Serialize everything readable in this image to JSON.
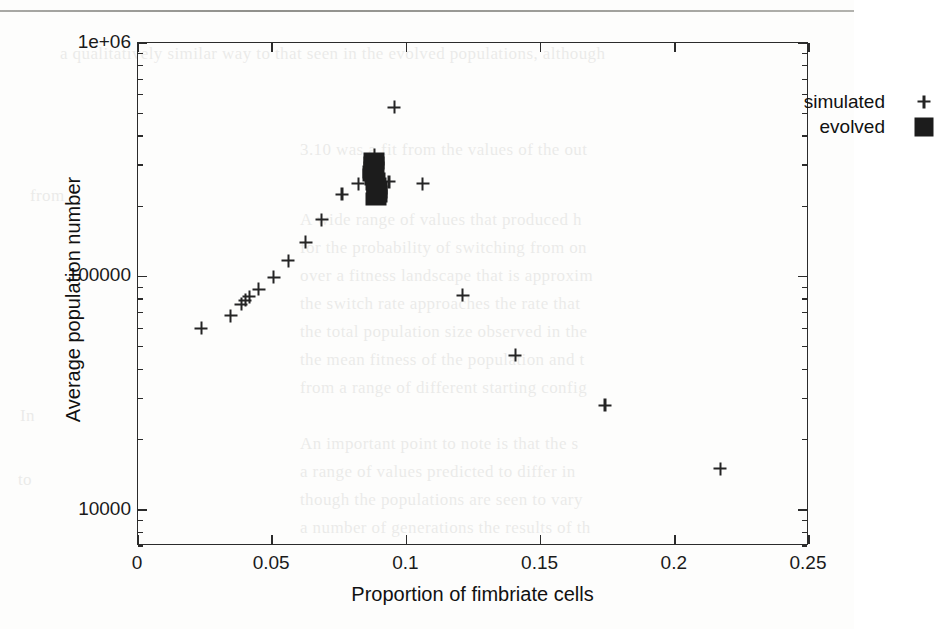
{
  "figure": {
    "xaxis_title": "Proportion of fimbriate cells",
    "yaxis_title": "Average population number"
  },
  "legend": {
    "position": "top-right",
    "entries": [
      {
        "label": "simulated",
        "marker": "plus-marker"
      },
      {
        "label": "evolved",
        "marker": "filled-square-marker"
      }
    ]
  },
  "axis_labels": {
    "x": [
      "0",
      "0.05",
      "0.1",
      "0.15",
      "0.2",
      "0.25"
    ],
    "y": [
      "10000",
      "100000",
      "1e+06"
    ]
  },
  "colors": {
    "marker": "#242424",
    "evolved": "#1c1c1c",
    "frame": "#2b2b2b",
    "background": "#fdfdfc"
  },
  "bleed_text": [
    {
      "left": 60,
      "top": 44,
      "text": "a qualitatively similar way to that seen in the evolved populations, although"
    },
    {
      "left": 300,
      "top": 140,
      "text": "3.10 was a fit from the values of the out"
    },
    {
      "left": 300,
      "top": 210,
      "text": "A wide range of values that produced h"
    },
    {
      "left": 300,
      "top": 238,
      "text": "for the probability of switching from on"
    },
    {
      "left": 300,
      "top": 266,
      "text": "over a fitness landscape that is approxim"
    },
    {
      "left": 300,
      "top": 294,
      "text": "the switch rate approaches the rate that"
    },
    {
      "left": 300,
      "top": 322,
      "text": "the total population size observed in the"
    },
    {
      "left": 300,
      "top": 350,
      "text": "the mean fitness of the population and t"
    },
    {
      "left": 300,
      "top": 378,
      "text": "from a range of different starting config"
    },
    {
      "left": 300,
      "top": 434,
      "text": "An important point to note is that the s"
    },
    {
      "left": 300,
      "top": 462,
      "text": "a range of values predicted to differ in"
    },
    {
      "left": 300,
      "top": 490,
      "text": "though the populations are seen to vary"
    },
    {
      "left": 300,
      "top": 518,
      "text": "a number of generations the results of th"
    },
    {
      "left": 30,
      "top": 186,
      "text": "from"
    },
    {
      "left": 20,
      "top": 406,
      "text": "In"
    },
    {
      "left": 18,
      "top": 470,
      "text": "to"
    }
  ],
  "chart_data": {
    "type": "scatter",
    "title": "",
    "xlabel": "Proportion of fimbriate cells",
    "ylabel": "Average population number",
    "xlim": [
      0,
      0.25
    ],
    "ylim": [
      7000,
      1000000
    ],
    "yscale": "log",
    "xscale": "linear",
    "grid": false,
    "xticks": [
      0,
      0.05,
      0.1,
      0.15,
      0.2,
      0.25
    ],
    "yticks": [
      10000,
      100000,
      1000000
    ],
    "ytick_labels": [
      "10000",
      "100000",
      "1e+06"
    ],
    "legend_position": "top-right",
    "series": [
      {
        "name": "simulated",
        "marker": "+",
        "points": [
          {
            "x": 0.0235,
            "y": 60000
          },
          {
            "x": 0.0345,
            "y": 68000
          },
          {
            "x": 0.0385,
            "y": 76000
          },
          {
            "x": 0.04,
            "y": 79000
          },
          {
            "x": 0.0415,
            "y": 82000
          },
          {
            "x": 0.045,
            "y": 88000
          },
          {
            "x": 0.0505,
            "y": 99000
          },
          {
            "x": 0.056,
            "y": 117000
          },
          {
            "x": 0.0625,
            "y": 140000
          },
          {
            "x": 0.0685,
            "y": 175000
          },
          {
            "x": 0.076,
            "y": 225000
          },
          {
            "x": 0.082,
            "y": 250000
          },
          {
            "x": 0.088,
            "y": 330000
          },
          {
            "x": 0.0935,
            "y": 255000
          },
          {
            "x": 0.0955,
            "y": 530000
          },
          {
            "x": 0.106,
            "y": 250000
          },
          {
            "x": 0.121,
            "y": 83000
          },
          {
            "x": 0.1405,
            "y": 46000
          },
          {
            "x": 0.174,
            "y": 28000
          },
          {
            "x": 0.217,
            "y": 15000
          }
        ]
      },
      {
        "name": "evolved",
        "marker": "filled-square",
        "cluster_center": {
          "x": 0.0885,
          "y": 265000
        },
        "points": [
          {
            "x": 0.088,
            "y": 320000
          },
          {
            "x": 0.088,
            "y": 305000
          },
          {
            "x": 0.0878,
            "y": 292000
          },
          {
            "x": 0.0876,
            "y": 280000
          },
          {
            "x": 0.0874,
            "y": 272000
          },
          {
            "x": 0.0884,
            "y": 262000
          },
          {
            "x": 0.0888,
            "y": 250000
          },
          {
            "x": 0.089,
            "y": 240000
          },
          {
            "x": 0.0892,
            "y": 230000
          },
          {
            "x": 0.089,
            "y": 222000
          },
          {
            "x": 0.0886,
            "y": 214000
          }
        ]
      }
    ]
  }
}
